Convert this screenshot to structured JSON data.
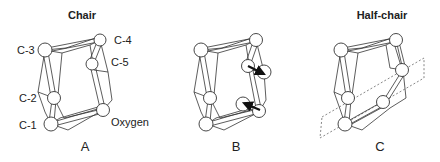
{
  "figure": {
    "panels": [
      {
        "id": "A",
        "title": "Chair",
        "letter": "A",
        "atom_labels": {
          "c3": "C-3",
          "c4": "C-4",
          "c5": "C-5",
          "c2": "C-2",
          "c1": "C-1",
          "oxygen": "Oxygen"
        }
      },
      {
        "id": "B",
        "title": "",
        "letter": "B",
        "annotation": "arrows indicating displacement of C-5 and oxygen"
      },
      {
        "id": "C",
        "title": "Half-chair",
        "letter": "C",
        "annotation": "dashed plane through C-1, C-2, oxygen, C-5"
      }
    ]
  }
}
